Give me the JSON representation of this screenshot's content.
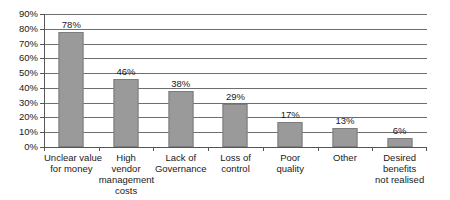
{
  "chart_data": {
    "type": "bar",
    "title": "",
    "subtitle": "",
    "xlabel": "",
    "ylabel": "",
    "ylim": [
      0,
      90
    ],
    "grid": true,
    "legend": "none",
    "orientation": "vertical",
    "categories": [
      "Unclear value for money",
      "High vendor management costs",
      "Lack of Governance",
      "Loss of control",
      "Poor quality",
      "Other",
      "Desired benefits not realised"
    ],
    "category_label_lines": [
      [
        "Unclear value",
        "for money"
      ],
      [
        "High",
        "vendor",
        "management",
        "costs"
      ],
      [
        "Lack of",
        "Governance"
      ],
      [
        "Loss of",
        "control"
      ],
      [
        "Poor",
        "quality"
      ],
      [
        "Other"
      ],
      [
        "Desired",
        "benefits",
        "not realised"
      ]
    ],
    "values": [
      78,
      46,
      38,
      29,
      17,
      13,
      6
    ],
    "data_labels": [
      "78%",
      "46%",
      "38%",
      "29%",
      "17%",
      "13%",
      "6%"
    ],
    "y_ticks": [
      0,
      10,
      20,
      30,
      40,
      50,
      60,
      70,
      80,
      90
    ],
    "y_tick_labels": [
      "0%",
      "10%",
      "20%",
      "30%",
      "40%",
      "50%",
      "60%",
      "70%",
      "80%",
      "90%"
    ],
    "colors": {
      "bar_fill": "#9a9a9a",
      "bar_stroke": "#7d7d7d",
      "gridline": "#6e6e6e",
      "axis": "#555555",
      "text": "#1a1a1a",
      "background": "#ffffff"
    }
  }
}
